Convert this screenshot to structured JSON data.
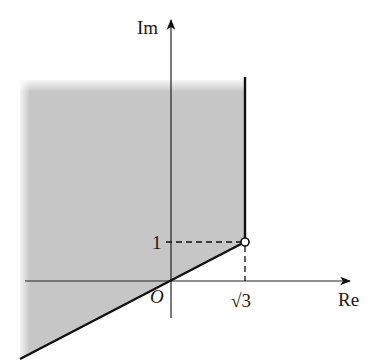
{
  "diagram": {
    "type": "complex-plane-region",
    "axes": {
      "x_label": "Re",
      "y_label": "Im",
      "origin_label": "O"
    },
    "ticks": {
      "x_tick_label": "√3",
      "y_tick_label": "1"
    },
    "special_point": {
      "label": "(√3, 1)",
      "style": "open-circle"
    },
    "region": {
      "description": "Shaded region bounded on the right by the vertical ray Re = √3 above Im = 1, and below by the ray from (√3, 1) through the origin O",
      "fill_color": "#c6c6c6"
    },
    "colors": {
      "line": "#111111",
      "axis": "#222222",
      "shade": "#c6c6c6",
      "background": "#ffffff"
    }
  }
}
